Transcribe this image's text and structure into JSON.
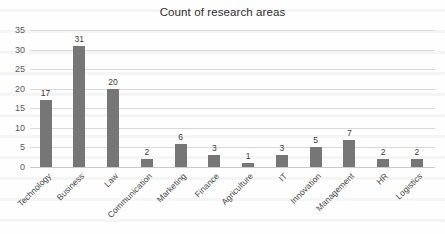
{
  "chart_data": {
    "type": "bar",
    "title": "Count of research areas",
    "xlabel": "",
    "ylabel": "",
    "categories": [
      "Technology",
      "Business",
      "Law",
      "Communication",
      "Marketing",
      "Finance",
      "Agriculture",
      "IT",
      "Innovation",
      "Management",
      "HR",
      "Logistics"
    ],
    "values": [
      17,
      31,
      20,
      2,
      6,
      3,
      1,
      3,
      5,
      7,
      2,
      2
    ],
    "ylim": [
      0,
      35
    ],
    "yticks": [
      0,
      5,
      10,
      15,
      20,
      25,
      30,
      35
    ],
    "grid": true,
    "legend": false,
    "data_labels": true,
    "bar_color": "#767676",
    "gridline_color": "#d9d9d9",
    "text_color": "#3a3a3a"
  }
}
